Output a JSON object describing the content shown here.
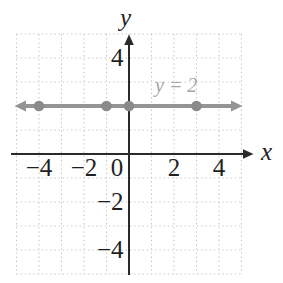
{
  "figure": {
    "width_px": 283,
    "height_px": 283,
    "background": "#ffffff"
  },
  "chart_data": {
    "type": "line",
    "equation_label": "y = 2",
    "line": {
      "equation": "y = 2",
      "y": 2,
      "slope": 0,
      "x_start": -4.9,
      "x_end": 4.9,
      "arrows_both_ends": true
    },
    "points": [
      {
        "x": -4,
        "y": 2
      },
      {
        "x": -1,
        "y": 2
      },
      {
        "x": 0,
        "y": 2
      },
      {
        "x": 3,
        "y": 2
      }
    ],
    "x_axis": {
      "label": "x",
      "range": [
        -5,
        5
      ],
      "tick_values": [
        -4,
        -2,
        0,
        2,
        4
      ],
      "tick_labels": [
        "−4",
        "−2",
        "0",
        "2",
        "4"
      ]
    },
    "y_axis": {
      "label": "y",
      "range": [
        -5,
        5
      ],
      "tick_values": [
        4,
        -2,
        -4
      ],
      "tick_labels": [
        "4",
        "−2",
        "−4"
      ]
    },
    "grid": {
      "show": true,
      "step": 1,
      "style": "dotted"
    },
    "colors": {
      "background": "#ffffff",
      "grid": "#c7c7c7",
      "axis": "#2a2a2a",
      "tick_text": "#1f1f1f",
      "line": "#949494",
      "point": "#8a8a8a",
      "equation_text": "#a5a5a5"
    }
  }
}
